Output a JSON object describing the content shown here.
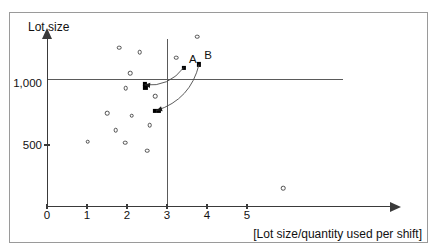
{
  "chart_data": {
    "type": "scatter",
    "title": "",
    "xlabel": "[Lot size/quantity used per shift]",
    "ylabel": "Lot size",
    "xlim": [
      0,
      5.9
    ],
    "ylim": [
      0,
      1500
    ],
    "grid": false,
    "legend": null,
    "x_ticks": [
      {
        "value": 0,
        "label": "0"
      },
      {
        "value": 1,
        "label": "1"
      },
      {
        "value": 2,
        "label": "2"
      },
      {
        "value": 3,
        "label": "3"
      },
      {
        "value": 4,
        "label": "4"
      },
      {
        "value": 5,
        "label": "5"
      }
    ],
    "y_ticks": [
      {
        "value": 500,
        "label": "500"
      },
      {
        "value": 1000,
        "label": "1,000"
      }
    ],
    "reference_lines": [
      {
        "name": "horizontal-reference-line",
        "orientation": "horizontal",
        "value": 1000
      },
      {
        "name": "vertical-reference-line",
        "orientation": "vertical",
        "value": 3
      }
    ],
    "series": [
      {
        "name": "observations",
        "marker": "open-circle",
        "points": [
          {
            "x": 1.02,
            "y": 525
          },
          {
            "x": 1.5,
            "y": 755
          },
          {
            "x": 1.72,
            "y": 620
          },
          {
            "x": 1.8,
            "y": 1285
          },
          {
            "x": 1.96,
            "y": 520
          },
          {
            "x": 1.97,
            "y": 960
          },
          {
            "x": 2.08,
            "y": 1080
          },
          {
            "x": 2.12,
            "y": 735
          },
          {
            "x": 2.32,
            "y": 1250
          },
          {
            "x": 2.5,
            "y": 455
          },
          {
            "x": 2.57,
            "y": 660
          },
          {
            "x": 2.7,
            "y": 895
          },
          {
            "x": 3.23,
            "y": 1205
          },
          {
            "x": 3.75,
            "y": 1375
          },
          {
            "x": 5.9,
            "y": 150
          }
        ]
      },
      {
        "name": "highlighted-positions",
        "marker": "filled-square",
        "points": [
          {
            "x": 3.42,
            "y": 1125,
            "label": "A"
          },
          {
            "x": 3.8,
            "y": 1150,
            "label": "B"
          },
          {
            "x": 2.44,
            "y": 990
          },
          {
            "x": 2.46,
            "y": 965
          },
          {
            "x": 2.7,
            "y": 775
          },
          {
            "x": 2.8,
            "y": 778
          }
        ]
      }
    ],
    "annotations": [
      {
        "name": "arrow-from-a",
        "from": {
          "x": 3.42,
          "y": 1125
        },
        "to": {
          "x": 2.44,
          "y": 985
        },
        "style": "curved-arrow"
      },
      {
        "name": "arrow-from-b",
        "from": {
          "x": 3.8,
          "y": 1150
        },
        "to": {
          "x": 2.74,
          "y": 778
        },
        "style": "curved-arrow"
      }
    ],
    "point_labels": [
      {
        "text": "A",
        "x": 3.42,
        "y": 1125
      },
      {
        "text": "B",
        "x": 3.8,
        "y": 1150
      }
    ]
  }
}
